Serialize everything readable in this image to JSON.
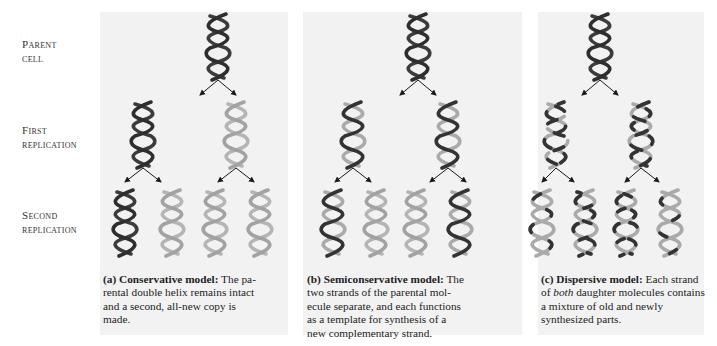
{
  "row_labels": [
    {
      "line1": "Parent",
      "line2": "cell"
    },
    {
      "line1": "First",
      "line2": "replication"
    },
    {
      "line1": "Second",
      "line2": "replication"
    }
  ],
  "colors": {
    "panel_bg": "#f2f2f2",
    "old_strand": "#3c3c3c",
    "new_strand": "#a8a8a8",
    "arrow": "#1a1a1a"
  },
  "panels": [
    {
      "id": "a",
      "caption_title": "(a) Conservative model:",
      "caption_lines": [
        "The pa-",
        "rental double helix remains intact",
        "and a second, all-new copy is",
        "made."
      ]
    },
    {
      "id": "b",
      "caption_title": "(b) Semiconservative model:",
      "caption_lines": [
        "The",
        "two strands of the parental mol-",
        "ecule separate, and each functions",
        "as a template for synthesis of a",
        "new complementary strand."
      ]
    },
    {
      "id": "c",
      "caption_title": "(c) Dispersive model:",
      "caption_lines": [
        "Each strand",
        "of ",
        "both",
        " daughter molecules contains",
        "a mixture of old and newly",
        "synthesized parts."
      ]
    }
  ]
}
